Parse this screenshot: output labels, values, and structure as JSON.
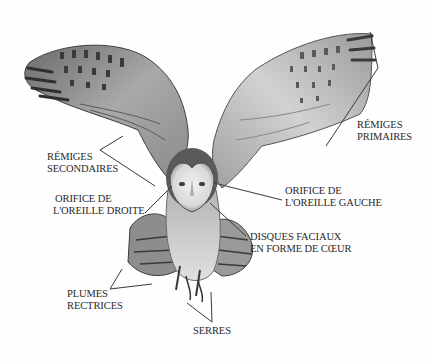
{
  "diagram": {
    "colors": {
      "background": "#fefefe",
      "label_text": "#2a2a2a",
      "leader_line": "#3a3a3a",
      "feather_light": "#c9c9c9",
      "feather_dark": "#4a4a4a",
      "face_disc": "#e6e6e6"
    },
    "labels": [
      {
        "id": "remiges-primaires",
        "lines": [
          "RÉMIGES",
          "PRIMAIRES"
        ]
      },
      {
        "id": "remiges-secondaires",
        "lines": [
          "RÉMIGES",
          "SECONDAIRES"
        ]
      },
      {
        "id": "orifice-oreille-droite",
        "lines": [
          "ORIFICE DE",
          "L'OREILLE DROITE"
        ]
      },
      {
        "id": "orifice-oreille-gauche",
        "lines": [
          "ORIFICE DE",
          "L'OREILLE GAUCHE"
        ]
      },
      {
        "id": "disques-faciaux",
        "lines": [
          "DISQUES FACIAUX",
          "EN FORME DE CŒUR"
        ]
      },
      {
        "id": "plumes-rectrices",
        "lines": [
          "PLUMES",
          "RECTRICES"
        ]
      },
      {
        "id": "serres",
        "lines": [
          "SERRES"
        ]
      }
    ]
  }
}
